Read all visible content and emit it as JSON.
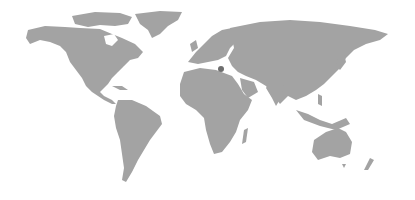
{
  "map": {
    "type": "world-map",
    "style": "grayscale silhouette",
    "land_color": "#a3a3a3",
    "background_color": "#ffffff",
    "marker": {
      "color": "#6e6e6e",
      "x": 221,
      "y": 69
    }
  }
}
